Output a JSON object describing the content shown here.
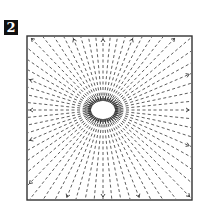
{
  "figure": {
    "step_number": "2",
    "colors": {
      "ink": "#333333",
      "background": "#ffffff",
      "badge_bg": "#111111",
      "badge_text": "#ffffff"
    }
  }
}
